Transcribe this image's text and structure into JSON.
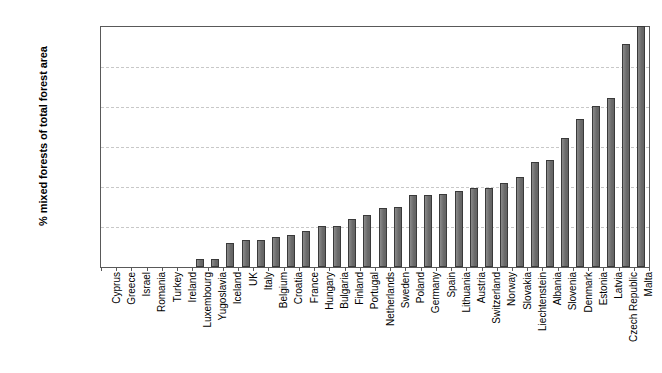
{
  "chart_data": {
    "type": "bar",
    "title": "",
    "subtitle": "",
    "xlabel": "",
    "ylabel": "% mixed forests of total forest area",
    "ylim": [
      0,
      60
    ],
    "ytick_step": 10,
    "ytick_labels": [
      "0.0",
      "10.0",
      "20.0",
      "30.0",
      "40.0",
      "50.0",
      "60.0"
    ],
    "ytick_values": [
      0,
      10,
      20,
      30,
      40,
      50,
      60
    ],
    "grid": "horizontal-dashed",
    "legend": "none",
    "bar_color": "#6e6e6e",
    "bar_edge_color": "#3a3a3a",
    "axis_color": "#595959",
    "grid_color": "#c8c8c8",
    "categories": [
      "Cyprus",
      "Greece",
      "Israel",
      "Romania",
      "Turkey",
      "Ireland",
      "Luxembourg",
      "Yugoslavia",
      "Iceland",
      "UK",
      "Italy",
      "Belgium",
      "Croatia",
      "France",
      "Hungary",
      "Bulgaria",
      "Finland",
      "Portugal",
      "Netherlands",
      "Sweden",
      "Poland",
      "Germany",
      "Spain",
      "Lithuania",
      "Austria",
      "Switzerland",
      "Norway",
      "Slovakia",
      "Liechtenstein",
      "Albania",
      "Slovenia",
      "Denmark",
      "Estonia",
      "Latvia",
      "Czech Republic",
      "Malta"
    ],
    "values": [
      0.0,
      0.0,
      0.0,
      0.0,
      0.0,
      0.0,
      2.0,
      2.0,
      6.0,
      6.8,
      6.8,
      7.5,
      8.0,
      9.0,
      10.2,
      10.3,
      12.0,
      12.9,
      14.7,
      15.1,
      18.0,
      18.1,
      18.2,
      19.1,
      19.7,
      19.8,
      21.0,
      22.5,
      26.2,
      26.8,
      32.3,
      37.0,
      40.2,
      42.3,
      55.7,
      60.3
    ]
  }
}
